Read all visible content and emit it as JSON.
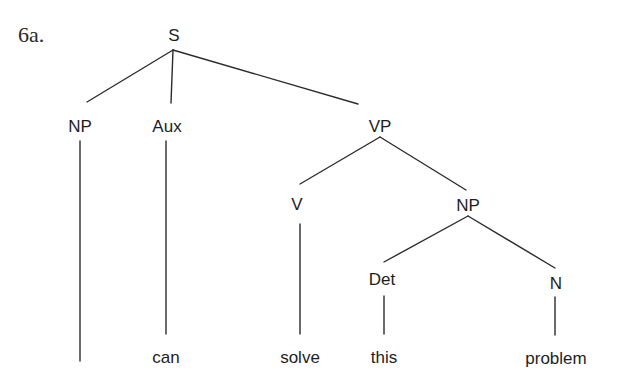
{
  "example_number": "6a.",
  "tree": {
    "nodes": {
      "S": {
        "label": "S"
      },
      "NP_subject": {
        "label": "NP"
      },
      "Aux": {
        "label": "Aux"
      },
      "VP": {
        "label": "VP"
      },
      "V": {
        "label": "V"
      },
      "NP_object": {
        "label": "NP"
      },
      "Det": {
        "label": "Det"
      },
      "N": {
        "label": "N"
      }
    },
    "leaves": {
      "NP_subject": "",
      "Aux": "can",
      "V": "solve",
      "Det": "this",
      "N": "problem"
    },
    "edges": [
      [
        "S",
        "NP_subject"
      ],
      [
        "S",
        "Aux"
      ],
      [
        "S",
        "VP"
      ],
      [
        "VP",
        "V"
      ],
      [
        "VP",
        "NP_object"
      ],
      [
        "NP_object",
        "Det"
      ],
      [
        "NP_object",
        "N"
      ],
      [
        "NP_subject",
        "leaf:(empty)"
      ],
      [
        "Aux",
        "leaf:can"
      ],
      [
        "V",
        "leaf:solve"
      ],
      [
        "Det",
        "leaf:this"
      ],
      [
        "N",
        "leaf:problem"
      ]
    ]
  },
  "colors": {
    "line": "#2b2b2b",
    "text": "#1e1e1e",
    "background": "#ffffff"
  }
}
